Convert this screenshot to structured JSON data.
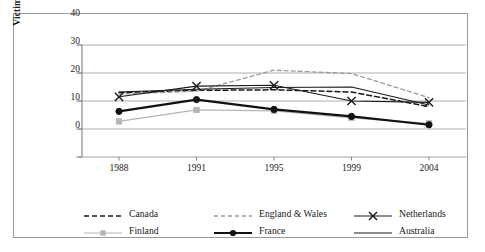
{
  "chart_data": {
    "type": "line",
    "title": "",
    "xlabel": "",
    "ylabel": "Victimizations per 100 persons",
    "categories": [
      "1988",
      "1991",
      "1995",
      "1999",
      "2004"
    ],
    "x_tick_labels": [
      "1988",
      "1991",
      "1995",
      "1999",
      "2004"
    ],
    "y_tick_labels": [
      "0",
      "10",
      "20",
      "30",
      "40"
    ],
    "ylim": [
      0,
      40
    ],
    "y_ticks": [
      0,
      10,
      20,
      30,
      40
    ],
    "grid": "horizontal",
    "legend_position": "bottom",
    "series": [
      {
        "name": "Canada",
        "values": [
          23.0,
          23.8,
          24.0,
          23.2,
          18.0
        ],
        "color": "#1a1a1a",
        "style": "dashed",
        "marker": "none",
        "width": 1.5
      },
      {
        "name": "England & Wales",
        "values": [
          22.5,
          23.5,
          31.0,
          29.8,
          21.2
        ],
        "color": "#9b9b9b",
        "style": "dashed",
        "marker": "none",
        "width": 1.3
      },
      {
        "name": "Netherlands",
        "values": [
          21.5,
          25.3,
          25.6,
          20.0,
          19.5
        ],
        "color": "#1a1a1a",
        "style": "solid",
        "marker": "x",
        "width": 1.1
      },
      {
        "name": "Finland",
        "values": [
          12.7,
          16.8,
          16.5,
          14.0,
          12.0
        ],
        "color": "#b5b5b5",
        "style": "solid",
        "marker": "square",
        "width": 1.2
      },
      {
        "name": "France",
        "values": [
          16.3,
          20.5,
          17.0,
          14.5,
          11.5
        ],
        "color": "#111111",
        "style": "solid",
        "marker": "circle",
        "width": 2.1
      },
      {
        "name": "Australia",
        "values": [
          23.2,
          24.2,
          24.8,
          25.0,
          18.6
        ],
        "color": "#1a1a1a",
        "style": "solid",
        "marker": "none",
        "width": 1.1
      }
    ]
  },
  "legend": {
    "entries": [
      {
        "label": "Canada"
      },
      {
        "label": "England & Wales"
      },
      {
        "label": "Netherlands"
      },
      {
        "label": "Finland"
      },
      {
        "label": "France"
      },
      {
        "label": "Australia"
      }
    ]
  },
  "colors": {
    "axis": "#808080",
    "grid": "#a6a6a6",
    "frame": "#9a9a9a",
    "text": "#1a1a1a"
  }
}
